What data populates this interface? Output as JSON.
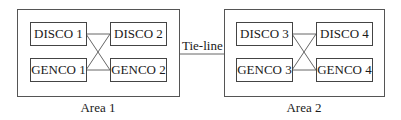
{
  "diagram": {
    "areas": [
      {
        "label": "Area 1",
        "nodes": {
          "disco_a": "DISCO 1",
          "disco_b": "DISCO 2",
          "genco_a": "GENCO 1",
          "genco_b": "GENCO 2"
        }
      },
      {
        "label": "Area 2",
        "nodes": {
          "disco_a": "DISCO 3",
          "disco_b": "DISCO 4",
          "genco_a": "GENCO 3",
          "genco_b": "GENCO 4"
        }
      }
    ],
    "tie_line_label": "Tie-line",
    "connections": [
      [
        "DISCO 1",
        "DISCO 2"
      ],
      [
        "GENCO 1",
        "GENCO 2"
      ],
      [
        "DISCO 1",
        "GENCO 2"
      ],
      [
        "GENCO 1",
        "DISCO 2"
      ],
      [
        "DISCO 3",
        "DISCO 4"
      ],
      [
        "GENCO 3",
        "GENCO 4"
      ],
      [
        "DISCO 3",
        "GENCO 4"
      ],
      [
        "GENCO 3",
        "DISCO 4"
      ],
      [
        "Area 1",
        "Area 2"
      ]
    ],
    "colors": {
      "line": "#555555",
      "background": "#ffffff",
      "text": "#1a1a1a"
    }
  }
}
